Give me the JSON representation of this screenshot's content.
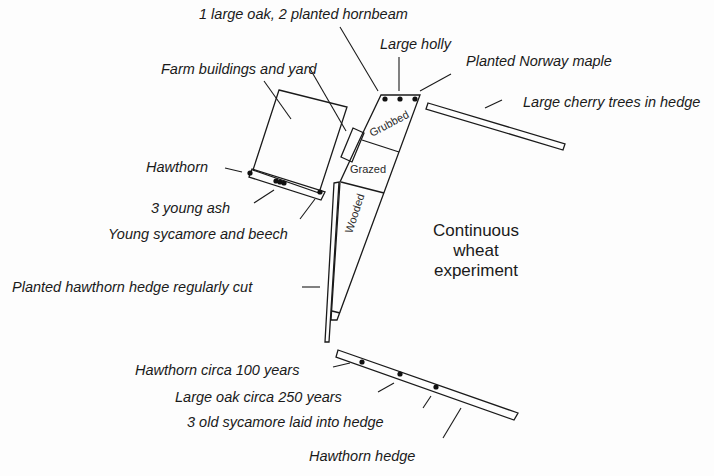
{
  "diagram": {
    "type": "field-boundary-map",
    "center_label": {
      "lines": [
        "Continuous",
        "wheat",
        "experiment"
      ]
    },
    "zones": {
      "grubbed": "Grubbed",
      "grazed": "Grazed",
      "wooded": "Wooded"
    },
    "labels": {
      "oak_hornbeam": "1 large oak, 2 planted hornbeam",
      "holly": "Large holly",
      "norway_maple": "Planted Norway maple",
      "cherry": "Large cherry trees in hedge",
      "farm": "Farm buildings and yard",
      "hawthorn": "Hawthorn",
      "young_ash": "3 young ash",
      "sycamore_beech": "Young sycamore and beech",
      "planted_hawthorn": "Planted hawthorn hedge regularly cut",
      "hawthorn_100": "Hawthorn circa 100 years",
      "oak_250": "Large oak circa 250 years",
      "old_sycamore": "3 old sycamore laid into hedge",
      "hawthorn_hedge": "Hawthorn hedge"
    },
    "colors": {
      "ink": "#1a1a1a",
      "paper": "#fdfdfd"
    }
  }
}
